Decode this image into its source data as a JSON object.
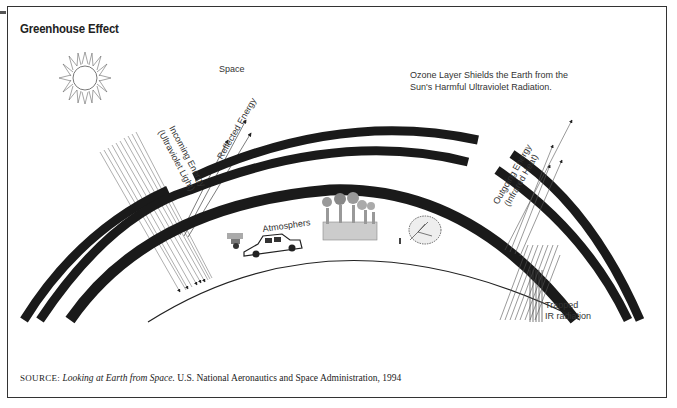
{
  "figure": {
    "title": "Greenhouse Effect",
    "labels": {
      "space": "Space",
      "ozone_line1": "Ozone Layer Shields the Earth from the",
      "ozone_line2": "Sun's Harmful Ultraviolet Radiation.",
      "incoming_line1": "Incoming Energy",
      "incoming_line2": "(Ultraviolet Light)",
      "reflected": "Reflected Energy",
      "atmosphere": "Atmosphers",
      "outgoing_line1": "Outgoing Energy",
      "outgoing_line2": "(Infrared Heat)",
      "trapped_line1": "Trapped",
      "trapped_line2": "IR radiation"
    },
    "icons": [
      "sun-icon",
      "car-icon",
      "factory-icon",
      "tree-icon",
      "smoke-icon"
    ],
    "colors": {
      "ink": "#1a1a1a",
      "text": "#333333",
      "background": "#ffffff"
    }
  },
  "source": {
    "prefix": "SOURCE:",
    "title": "Looking at Earth from Space.",
    "rest": " U.S. National Aeronautics and Space Administration, 1994"
  }
}
